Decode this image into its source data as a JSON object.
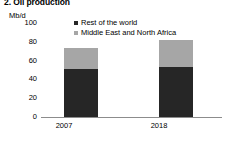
{
  "chart_data": {
    "type": "bar",
    "subtype": "stacked-column",
    "title": "2. Oil production",
    "unit_label": "Mb/d",
    "categories": [
      "2007",
      "2018"
    ],
    "series": [
      {
        "name": "Middle East and North Africa",
        "color": "#a6a6a6",
        "values": [
          22,
          29
        ]
      },
      {
        "name": "Rest of the world",
        "color": "#262626",
        "values": [
          51,
          53
        ]
      }
    ],
    "totals": [
      73,
      82
    ],
    "stack_order_bottom_to_top": [
      "Rest of the world",
      "Middle East and North Africa"
    ],
    "legend_order": [
      "Rest of the world",
      "Middle East and North Africa"
    ],
    "legend_position": "top-center",
    "xlabel": "",
    "ylabel": "Mb/d",
    "ylim": [
      0,
      100
    ],
    "yticks": [
      100,
      80,
      60,
      40,
      20,
      0
    ],
    "ytick_labels": [
      "100",
      "80",
      "60",
      "40",
      "20",
      "0"
    ],
    "grid": false,
    "axis_color": "#8c8c8c",
    "background": "#ffffff"
  }
}
